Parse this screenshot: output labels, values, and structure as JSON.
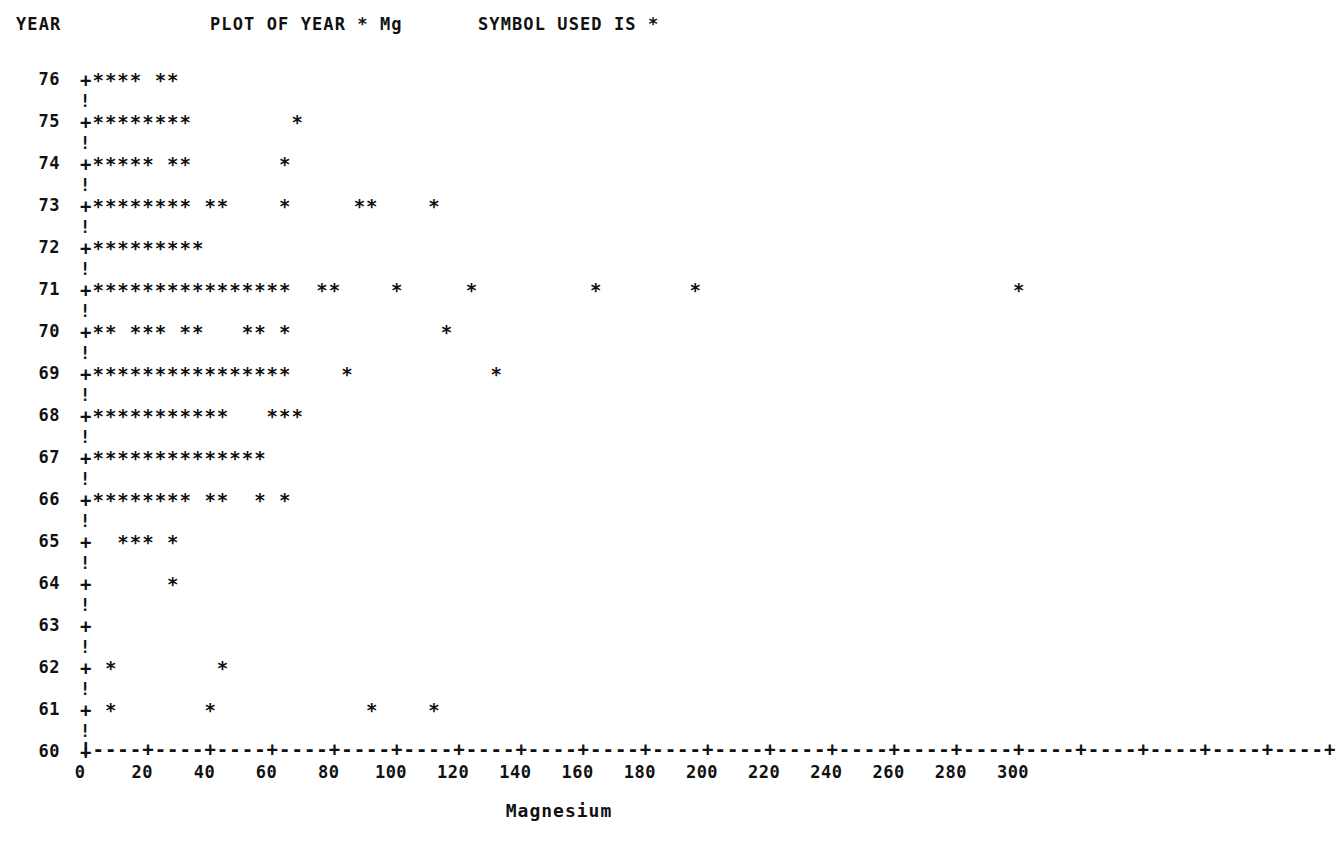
{
  "header": {
    "year_label": "YEAR",
    "plot_title": "PLOT OF YEAR * Mg",
    "symbol_note": "SYMBOL USED IS *"
  },
  "axis": {
    "x_title": "Magnesium",
    "x_ticks": [
      0,
      20,
      40,
      60,
      80,
      100,
      120,
      140,
      160,
      180,
      200,
      220,
      240,
      260,
      280,
      300
    ],
    "x_min": 0,
    "x_max": 320,
    "units_per_char": 4,
    "axis_line": "!----+----+----+----+----+----+----+----+----+----+----+----+----+----+----+----+----+----+----+----+",
    "separator_char": "!",
    "tick_char": "+",
    "symbol_char": "*"
  },
  "chart_data": {
    "type": "scatter",
    "title": "PLOT OF YEAR * Mg",
    "xlabel": "Magnesium",
    "ylabel": "YEAR",
    "xlim": [
      0,
      320
    ],
    "grid": false,
    "legend": "SYMBOL USED IS *",
    "note": "Character-cell plot: each '*' occupies one 4-unit-wide column; row label is the YEAR.",
    "categories": [
      76,
      75,
      74,
      73,
      72,
      71,
      70,
      69,
      68,
      67,
      66,
      65,
      64,
      63,
      62,
      61,
      60
    ],
    "rows": [
      {
        "year": 76,
        "line": "+****  **",
        "values": [
          4,
          8,
          12,
          16,
          24,
          28
        ]
      },
      {
        "year": 75,
        "line": "+********        *",
        "values": [
          4,
          8,
          12,
          16,
          20,
          24,
          28,
          32,
          68
        ]
      },
      {
        "year": 74,
        "line": "+*****  **      *",
        "values": [
          4,
          8,
          12,
          16,
          20,
          28,
          32,
          64
        ]
      },
      {
        "year": 73,
        "line": "+********  **     *     **    *",
        "values": [
          4,
          8,
          12,
          16,
          20,
          24,
          28,
          32,
          40,
          44,
          64,
          88,
          92,
          112
        ]
      },
      {
        "year": 72,
        "line": "+*********",
        "values": [
          4,
          8,
          12,
          16,
          20,
          24,
          28,
          32,
          36
        ]
      },
      {
        "year": 71,
        "line": "+****************   **      *      *       *       *                   *",
        "values": [
          4,
          8,
          12,
          16,
          20,
          24,
          28,
          32,
          36,
          40,
          44,
          48,
          52,
          56,
          60,
          64,
          76,
          80,
          100,
          124,
          164,
          194,
          300
        ]
      },
      {
        "year": 70,
        "line": "+**  ***  **    ** *         *",
        "values": [
          4,
          8,
          16,
          20,
          24,
          32,
          36,
          52,
          56,
          64,
          116
        ]
      },
      {
        "year": 69,
        "line": "+****************    *        *",
        "values": [
          4,
          8,
          12,
          16,
          20,
          24,
          28,
          32,
          36,
          40,
          44,
          48,
          52,
          56,
          60,
          64,
          84,
          132
        ]
      },
      {
        "year": 68,
        "line": "+***********   ***",
        "values": [
          4,
          8,
          12,
          16,
          20,
          24,
          28,
          32,
          36,
          40,
          44,
          60,
          64,
          68
        ]
      },
      {
        "year": 67,
        "line": "+**************",
        "values": [
          4,
          8,
          12,
          16,
          20,
          24,
          28,
          32,
          36,
          40,
          44,
          48,
          52,
          56
        ]
      },
      {
        "year": 66,
        "line": "+********  **  * *",
        "values": [
          4,
          8,
          12,
          16,
          20,
          24,
          28,
          32,
          40,
          44,
          56,
          64
        ]
      },
      {
        "year": 65,
        "line": "+ *** *",
        "values": [
          12,
          16,
          20,
          28
        ]
      },
      {
        "year": 64,
        "line": "+      *",
        "values": [
          28
        ]
      },
      {
        "year": 63,
        "line": "+",
        "values": []
      },
      {
        "year": 62,
        "line": "+ *      *",
        "values": [
          8,
          44
        ]
      },
      {
        "year": 61,
        "line": "+ *       *            *     *",
        "values": [
          8,
          40,
          92,
          112
        ]
      },
      {
        "year": 60,
        "line": "+",
        "values": []
      }
    ]
  }
}
